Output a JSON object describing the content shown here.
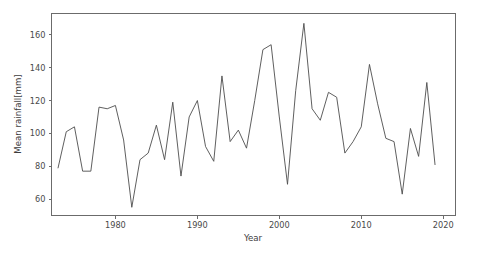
{
  "chart_data": {
    "type": "line",
    "title": "",
    "xlabel": "Year",
    "ylabel": "Mean rainfall[mm]",
    "xlim": [
      1972.2,
      2021.5
    ],
    "ylim": [
      50.0,
      173.0
    ],
    "xticks": [
      1980,
      1990,
      2000,
      2010,
      2020
    ],
    "xticklabels": [
      "1980",
      "1990",
      "2000",
      "2010",
      "2020"
    ],
    "yticks": [
      60,
      80,
      100,
      120,
      140,
      160
    ],
    "yticklabels": [
      "60",
      "80",
      "100",
      "120",
      "140",
      "160"
    ],
    "grid": false,
    "legend": false,
    "line_color": "#4d4d4d",
    "series": [
      {
        "name": "Mean rainfall",
        "x": [
          1973,
          1974,
          1975,
          1976,
          1977,
          1978,
          1979,
          1980,
          1981,
          1982,
          1983,
          1984,
          1985,
          1986,
          1987,
          1988,
          1989,
          1990,
          1991,
          1992,
          1993,
          1994,
          1995,
          1996,
          1997,
          1998,
          1999,
          2000,
          2001,
          2002,
          2003,
          2004,
          2005,
          2006,
          2007,
          2008,
          2009,
          2010,
          2011,
          2012,
          2013,
          2014,
          2015,
          2016,
          2017,
          2018,
          2019
        ],
        "values": [
          79,
          101,
          104,
          77,
          77,
          116,
          115,
          117,
          96,
          55,
          84,
          88,
          105,
          84,
          119,
          74,
          110,
          120,
          92,
          83,
          135,
          95,
          102,
          91,
          120,
          151,
          154,
          110,
          69,
          126,
          167,
          115,
          108,
          125,
          122,
          88,
          95,
          104,
          142,
          118,
          97,
          95,
          63,
          103,
          86,
          131,
          81
        ]
      }
    ]
  },
  "figure": {
    "background_color": "#ffffff",
    "axes_color": "#6b6b6b",
    "text_color": "#4a4a4a"
  }
}
